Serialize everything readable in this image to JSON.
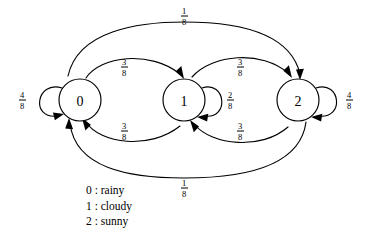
{
  "diagram": {
    "type": "markov-chain-state-transition-diagram",
    "states": [
      {
        "id": "0",
        "label": "0",
        "name": "rainy",
        "cx": 80,
        "cy": 100
      },
      {
        "id": "1",
        "label": "1",
        "name": "cloudy",
        "cx": 184,
        "cy": 100
      },
      {
        "id": "2",
        "label": "2",
        "name": "sunny",
        "cx": 298,
        "cy": 100
      }
    ],
    "transitions": [
      {
        "from": "0",
        "to": "0",
        "numerator": "4",
        "denominator": "8",
        "value": 0.5,
        "label_x": 22,
        "label_y": 100,
        "kind": "self-loop-left"
      },
      {
        "from": "0",
        "to": "1",
        "numerator": "3",
        "denominator": "8",
        "value": 0.375,
        "label_x": 124,
        "label_y": 67,
        "kind": "arc-top"
      },
      {
        "from": "0",
        "to": "2",
        "numerator": "1",
        "denominator": "8",
        "value": 0.125,
        "label_x": 184,
        "label_y": 16,
        "kind": "arc-top-long"
      },
      {
        "from": "1",
        "to": "0",
        "numerator": "3",
        "denominator": "8",
        "value": 0.375,
        "label_x": 124,
        "label_y": 131,
        "kind": "arc-bottom"
      },
      {
        "from": "1",
        "to": "1",
        "numerator": "2",
        "denominator": "8",
        "value": 0.25,
        "label_x": 230,
        "label_y": 100,
        "kind": "self-loop-right"
      },
      {
        "from": "1",
        "to": "2",
        "numerator": "3",
        "denominator": "8",
        "value": 0.375,
        "label_x": 240,
        "label_y": 67,
        "kind": "arc-top"
      },
      {
        "from": "2",
        "to": "1",
        "numerator": "3",
        "denominator": "8",
        "value": 0.375,
        "label_x": 240,
        "label_y": 131,
        "kind": "arc-bottom"
      },
      {
        "from": "2",
        "to": "0",
        "numerator": "1",
        "denominator": "8",
        "value": 0.125,
        "label_x": 184,
        "label_y": 188,
        "kind": "arc-bottom-long"
      },
      {
        "from": "2",
        "to": "2",
        "numerator": "4",
        "denominator": "8",
        "value": 0.5,
        "label_x": 349,
        "label_y": 100,
        "kind": "self-loop-right"
      }
    ],
    "legend": {
      "rows": [
        "0 : rainy",
        "1 : cloudy",
        "2 : sunny"
      ]
    },
    "colors": {
      "background": "#ffffff",
      "stroke": "#000000",
      "text": "#000000"
    }
  }
}
